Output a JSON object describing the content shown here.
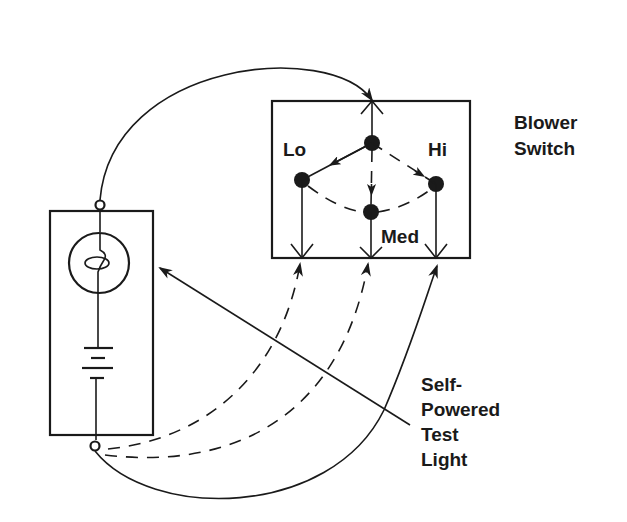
{
  "diagram": {
    "labels": {
      "blower_switch_line1": "Blower",
      "blower_switch_line2": "Switch",
      "lo": "Lo",
      "hi": "Hi",
      "med": "Med",
      "test_light_line1": "Self-",
      "test_light_line2": "Powered",
      "test_light_line3": "Test",
      "test_light_line4": "Light"
    },
    "components": {
      "blower_switch": {
        "name": "Blower Switch",
        "positions": [
          "Lo",
          "Med",
          "Hi"
        ],
        "terminals": [
          "input",
          "lo-out",
          "med-out",
          "hi-out"
        ]
      },
      "test_light": {
        "name": "Self-Powered Test Light",
        "elements": [
          "bulb",
          "battery",
          "top-lead",
          "bottom-lead"
        ]
      }
    },
    "connections": [
      {
        "from": "test-light-top-lead",
        "to": "switch-input-terminal",
        "style": "solid"
      },
      {
        "from": "test-light-bottom-lead",
        "to": "switch-lo-terminal",
        "style": "dashed"
      },
      {
        "from": "test-light-bottom-lead",
        "to": "switch-med-terminal",
        "style": "dashed"
      },
      {
        "from": "test-light-bottom-lead",
        "to": "switch-hi-terminal",
        "style": "solid"
      }
    ],
    "colors": {
      "ink": "#1a1a1a",
      "background": "#ffffff"
    }
  }
}
